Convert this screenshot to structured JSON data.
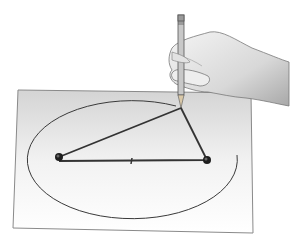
{
  "illustration": {
    "description": "Hand holding a pencil drawing an ellipse on paper using a string looped around two pins",
    "colors": {
      "background": "#ffffff",
      "paper_top": "#d6d6d6",
      "paper_bottom": "#ffffff",
      "paper_border": "#8a8a8a",
      "line": "#3a3a3a",
      "pin": "#1e1e1e",
      "skin_light": "#f0f0f0",
      "skin_shade": "#b5b5b5",
      "pencil": "#c8c8c8"
    },
    "paper": {
      "corners": [
        [
          18,
          90
        ],
        [
          251,
          93
        ],
        [
          253,
          233
        ],
        [
          13,
          228
        ]
      ]
    },
    "ellipse": {
      "cx": 135,
      "cy": 161,
      "rx": 105,
      "ry": 59
    },
    "pins": [
      {
        "x": 59,
        "y": 157
      },
      {
        "x": 207,
        "y": 160
      }
    ],
    "pencil_tip": {
      "x": 181,
      "y": 108
    }
  }
}
